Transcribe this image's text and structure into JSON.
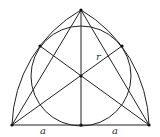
{
  "diagram": {
    "labels": {
      "radius": "r",
      "left_half_base": "a",
      "right_half_base": "a"
    },
    "colors": {
      "line": "#222222",
      "background": "#ffffff"
    }
  }
}
